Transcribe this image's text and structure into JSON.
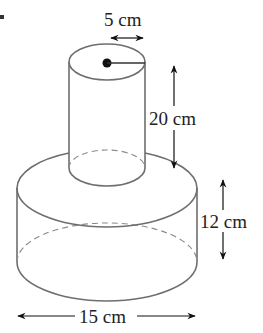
{
  "diagram": {
    "colors": {
      "outline": "#6e6e6e",
      "hidden_edge": "#8a8a8a",
      "arrow": "#111111",
      "text": "#222222",
      "background": "#ffffff"
    },
    "labels": {
      "small_radius": "5 cm",
      "small_height": "20 cm",
      "large_height": "12 cm",
      "large_diameter": "15 cm"
    },
    "shapes": {
      "small_cylinder": {
        "radius_label": "5 cm",
        "height_label": "20 cm",
        "center_dot": true
      },
      "large_cylinder": {
        "height_label": "12 cm",
        "diameter_label": "15 cm"
      }
    }
  }
}
